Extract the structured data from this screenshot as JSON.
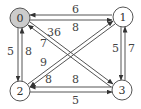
{
  "graph": {
    "type": "directed-weighted",
    "nodes": [
      {
        "id": "0",
        "label": "0",
        "x": 20,
        "y": 18,
        "fill": "#cccccc",
        "highlighted": true
      },
      {
        "id": "1",
        "label": "1",
        "x": 123,
        "y": 17,
        "fill": "#ffffff",
        "highlighted": false
      },
      {
        "id": "2",
        "label": "2",
        "x": 20,
        "y": 91,
        "fill": "#ffffff",
        "highlighted": false
      },
      {
        "id": "3",
        "label": "3",
        "x": 122,
        "y": 90,
        "fill": "#ffffff",
        "highlighted": false
      }
    ],
    "edges": [
      {
        "from": "1",
        "to": "0",
        "weight": "6"
      },
      {
        "from": "0",
        "to": "1",
        "weight": "8"
      },
      {
        "from": "0",
        "to": "2",
        "weight": "5"
      },
      {
        "from": "2",
        "to": "0",
        "weight": "8"
      },
      {
        "from": "1",
        "to": "3",
        "weight": "5"
      },
      {
        "from": "3",
        "to": "1",
        "weight": "7"
      },
      {
        "from": "3",
        "to": "2",
        "weight": "8"
      },
      {
        "from": "2",
        "to": "3",
        "weight": "5"
      },
      {
        "from": "0",
        "to": "3",
        "weight": "36"
      },
      {
        "from": "3",
        "to": "0",
        "weight": "7"
      },
      {
        "from": "2",
        "to": "1",
        "weight": "9"
      },
      {
        "from": "1",
        "to": "2",
        "weight": "8"
      }
    ]
  },
  "labels": {
    "n0": "0",
    "n1": "1",
    "n2": "2",
    "n3": "3",
    "e_1_0": "6",
    "e_0_1": "8",
    "e_0_2": "5",
    "e_2_0": "8",
    "e_1_3": "5",
    "e_3_1": "7",
    "e_3_2": "8",
    "e_2_3": "5",
    "e_0_3": "36",
    "e_3_0": "7",
    "e_2_1": "9",
    "e_1_2": "8"
  }
}
